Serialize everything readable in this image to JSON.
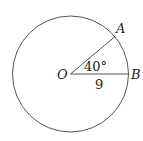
{
  "diagram": {
    "type": "circle-sector",
    "center_label": "O",
    "point_a_label": "A",
    "point_b_label": "B",
    "angle_label": "40°",
    "radius_label": "9",
    "stroke_color": "#555555",
    "background": "#ffffff"
  }
}
